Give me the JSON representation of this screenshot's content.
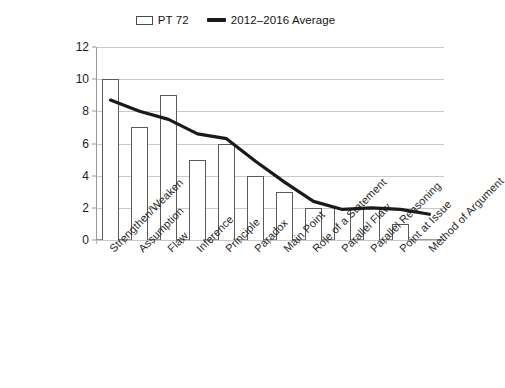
{
  "chart_data": {
    "type": "bar",
    "title": "",
    "subtitle": "",
    "xlabel": "",
    "ylabel": "",
    "ylim": [
      0,
      12
    ],
    "yticks": [
      0,
      2,
      4,
      6,
      8,
      10,
      12
    ],
    "grid": true,
    "legend_position": "top-center",
    "categories": [
      "Strengthen/Weaken",
      "Assumption",
      "Flaw",
      "Inference",
      "Principle",
      "Paradox",
      "Main Point",
      "Role of a Statement",
      "Parallel Flaw",
      "Parallel Reasoning",
      "Point at Issue",
      "Method of Argument"
    ],
    "series": [
      {
        "name": "PT 72",
        "type": "bar",
        "color": "#ffffff",
        "edge_color": "#5a5a5a",
        "values": [
          10,
          7,
          9,
          5,
          6,
          4,
          3,
          2,
          2,
          2,
          1,
          0
        ]
      },
      {
        "name": "2012–2016 Average",
        "type": "line",
        "color": "#1a1a1a",
        "values": [
          8.7,
          8.0,
          7.5,
          6.6,
          6.3,
          4.9,
          3.6,
          2.4,
          1.9,
          2.0,
          1.9,
          1.6
        ]
      }
    ]
  },
  "legend": {
    "entries": [
      {
        "label": "PT 72",
        "marker": "bar-swatch-icon"
      },
      {
        "label": "2012–2016 Average",
        "marker": "line-swatch-icon"
      }
    ]
  }
}
